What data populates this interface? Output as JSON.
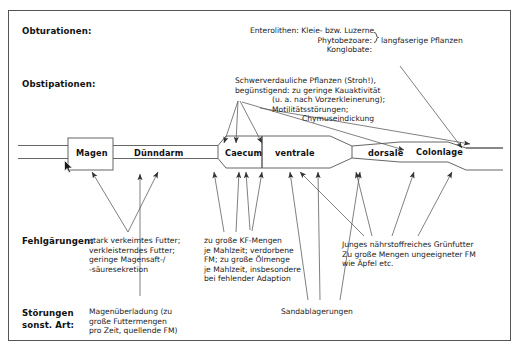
{
  "diagram": {
    "title_visible": false,
    "row_labels": [
      {
        "id": "obturationen",
        "text": "Obturationen:"
      },
      {
        "id": "obstipationen",
        "text": "Obstipationen:"
      },
      {
        "id": "fehlgaerungen",
        "text": "Fehlgärungen:"
      },
      {
        "id": "stoerungen",
        "text": "Störungen\nsonst. Art:"
      }
    ],
    "gut_segments": [
      {
        "id": "magen",
        "label": "Magen"
      },
      {
        "id": "duenndarm",
        "label": "Dünndarm"
      },
      {
        "id": "caecum",
        "label": "Caecum"
      },
      {
        "id": "ventrale",
        "label": "ventrale"
      },
      {
        "id": "dorsale",
        "label": "dorsale"
      },
      {
        "id": "colonlage",
        "label": "Colonlage"
      }
    ],
    "annotations": [
      {
        "id": "obturationen-note",
        "lines": [
          "Enterolithen: Kleie- bzw. Luzerne",
          "Phytobezoare:",
          "Konglobate:"
        ],
        "brace_text": "langfaserige Pflanzen"
      },
      {
        "id": "obstipationen-note",
        "lines": [
          "Schwerverdauliche Pflanzen (Stroh!),",
          "begünstigend: zu geringe Kauaktivität",
          "(u. a. nach Vorzerkleinerung);",
          "Motilitätsstörungen;",
          "Chymuseindickung"
        ]
      },
      {
        "id": "fehlgaerungen-note-1",
        "lines": [
          "stark verkeimtes Futter;",
          "verkleisterndes Futter;",
          "geringe Magensaft-/",
          "-säuresekretion"
        ]
      },
      {
        "id": "fehlgaerungen-note-2",
        "lines": [
          "zu große KF-Mengen",
          "je Mahlzeit; verdorbene",
          "FM; zu große Ölmenge",
          "je Mahlzeit, insbesondere",
          "bei fehlender Adaption"
        ]
      },
      {
        "id": "fehlgaerungen-note-3",
        "lines": [
          "Junges nährstoffreiches Grünfutter",
          "Zu große Mengen ungeeigneter FM",
          "wie Äpfel etc."
        ]
      },
      {
        "id": "stoerungen-note",
        "lines": [
          "Magenüberladung (zu",
          "große Futtermengen",
          "pro Zeit, quellende FM)"
        ]
      },
      {
        "id": "sandablagerungen-note",
        "lines": [
          "Sandablagerungen"
        ]
      }
    ],
    "colors": {
      "border": "#555555",
      "line": "#444444",
      "text": "#1a1a1a",
      "background": "#ffffff"
    }
  }
}
